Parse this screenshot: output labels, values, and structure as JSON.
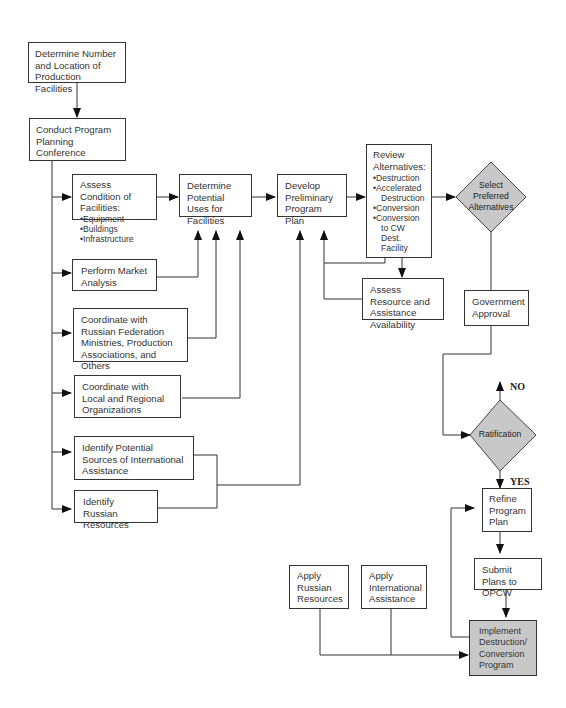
{
  "diagram": {
    "type": "flowchart",
    "nodes": {
      "determine_number": {
        "text": "Determine Number and Location of Production Facilities"
      },
      "conduct_conference": {
        "text": "Conduct Program Planning Conference"
      },
      "assess_condition": {
        "title": "Assess Condition of Facilities:",
        "bullets": [
          "Equipment",
          "Buildings",
          "Infrastructure"
        ]
      },
      "perform_market": {
        "text": "Perform Market Analysis"
      },
      "coordinate_russian": {
        "text": "Coordinate with Russian Federation Ministries, Production Associations, and Others"
      },
      "coordinate_local": {
        "text": "Coordinate with Local and Regional Organizations"
      },
      "identify_international": {
        "text": "Identify Potential Sources of International Assistance"
      },
      "identify_russian": {
        "text": "Identify Russian Resources"
      },
      "determine_uses": {
        "text": "Determine Potential Uses for Facilities"
      },
      "develop_plan": {
        "text": "Develop Preliminary Program Plan"
      },
      "review_alternatives": {
        "title": "Review Alternatives:",
        "bullets": [
          "Destruction",
          "Accelerated",
          "Destruction",
          "Conversion",
          "Conversion",
          "to CW Dest.",
          "Facility"
        ],
        "bullet_lines": [
          {
            "bullet": true,
            "text": "Destruction"
          },
          {
            "bullet": true,
            "text": "Accelerated",
            "cont": "Destruction"
          },
          {
            "bullet": true,
            "text": "Conversion"
          },
          {
            "bullet": true,
            "text": "Conversion",
            "cont": "to CW Dest."
          },
          {
            "bullet": false,
            "text": "Facility"
          }
        ],
        "b0": "Destruction",
        "b1": "Accelerated",
        "b1c": "Destruction",
        "b2": "Conversion",
        "b3": "Conversion",
        "b3c": "to CW Dest.",
        "b3c2": "Facility"
      },
      "assess_resource": {
        "text": "Assess Resource and Assistance Availability"
      },
      "select_preferred": {
        "text": "Select Preferred Alternatives",
        "shape": "diamond"
      },
      "government_approval": {
        "text": "Government Approval"
      },
      "ratification": {
        "text": "Ratification",
        "shape": "diamond"
      },
      "refine_plan": {
        "text": "Refine Program Plan"
      },
      "submit_plans": {
        "text": "Submit Plans to OPCW"
      },
      "apply_russian": {
        "text": "Apply Russian Resources"
      },
      "apply_international": {
        "text": "Apply International Assistance"
      },
      "implement_program": {
        "text": "Implement Destruction/ Conversion Program",
        "shaded": true
      }
    },
    "edge_labels": {
      "no": "NO",
      "yes": "YES"
    },
    "colors": {
      "line": "#333333",
      "shaded_fill": "#c8c8c8",
      "box_fill": "#ffffff"
    }
  }
}
